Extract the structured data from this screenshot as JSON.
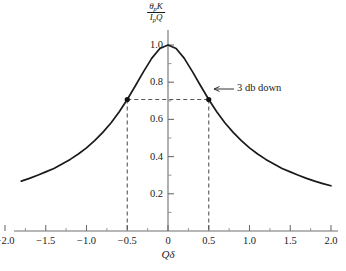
{
  "chart_data": {
    "type": "line",
    "title": "",
    "subtitle": "",
    "xlabel": "Qδ",
    "ylabel_numerator": "θpK",
    "ylabel_denominator": "IpQ",
    "ylabel": "θpK / IpQ",
    "xlim": [
      -2.15,
      2.15
    ],
    "ylim": [
      0,
      1.08
    ],
    "grid": false,
    "legend": false,
    "x_ticks": [
      -2.0,
      -1.5,
      -1.0,
      -0.5,
      0,
      0.5,
      1.0,
      1.5,
      2.0
    ],
    "x_tick_labels": [
      "−2.0",
      "−1.5",
      "−1.0",
      "−0.5",
      "0",
      "0.5",
      "1.0",
      "1.5",
      "2.0"
    ],
    "x_minor_ticks": [
      -1.75,
      -1.25,
      -0.75,
      -0.25,
      0.25,
      0.75,
      1.25,
      1.75
    ],
    "y_ticks": [
      0.2,
      0.4,
      0.6,
      0.8,
      1.0
    ],
    "y_tick_labels": [
      "0.2",
      "0.4",
      "0.6",
      "0.8",
      "1.0"
    ],
    "y_minor_ticks": [
      0.1,
      0.3,
      0.5,
      0.7,
      0.9
    ],
    "series": [
      {
        "name": "normalized resonance response",
        "formula": "1 / sqrt(1 + (2*x)^2)",
        "x": [
          -1.8,
          -1.7,
          -1.6,
          -1.5,
          -1.4,
          -1.3,
          -1.2,
          -1.1,
          -1.0,
          -0.9,
          -0.8,
          -0.7,
          -0.6,
          -0.5,
          -0.4,
          -0.3,
          -0.2,
          -0.1,
          0.0,
          0.1,
          0.2,
          0.3,
          0.4,
          0.5,
          0.6,
          0.7,
          0.8,
          0.9,
          1.0,
          1.1,
          1.2,
          1.3,
          1.4,
          1.5,
          1.6,
          1.7,
          1.8,
          1.9,
          2.0
        ],
        "y": [
          0.268,
          0.283,
          0.3,
          0.318,
          0.336,
          0.36,
          0.385,
          0.414,
          0.447,
          0.486,
          0.53,
          0.581,
          0.64,
          0.707,
          0.781,
          0.857,
          0.928,
          0.981,
          1.0,
          0.981,
          0.928,
          0.857,
          0.781,
          0.707,
          0.64,
          0.581,
          0.53,
          0.486,
          0.447,
          0.414,
          0.385,
          0.36,
          0.336,
          0.318,
          0.3,
          0.283,
          0.268,
          0.255,
          0.243
        ]
      }
    ],
    "markers": [
      {
        "x": -0.5,
        "y": 0.707
      },
      {
        "x": 0.5,
        "y": 0.707
      }
    ],
    "annotations": [
      {
        "text": "3 db down",
        "x": 0.5,
        "y": 0.707,
        "note": "arrow pointing left to right marker at half-power point"
      }
    ],
    "guide_lines": [
      {
        "type": "horizontal",
        "y": 0.707,
        "from_x": -0.5,
        "to_x": 0.5,
        "style": "dashed"
      },
      {
        "type": "vertical",
        "x": -0.5,
        "from_y": 0.0,
        "to_y": 0.707,
        "style": "dashed"
      },
      {
        "type": "vertical",
        "x": 0.5,
        "from_y": 0.0,
        "to_y": 0.707,
        "style": "dashed"
      }
    ],
    "peak_value": 1.0,
    "half_power_value": 0.707
  },
  "colors": {
    "curve": "#1a1a1a",
    "axis": "#6e6e6e",
    "dashed": "#555555",
    "marker": "#111111",
    "background": "#ffffff",
    "text": "#1a1a1a"
  },
  "xaxis": {
    "label": "Qδ",
    "tick_labels": [
      "−2.0",
      "−1.5",
      "−1.0",
      "−0.5",
      "0",
      "0.5",
      "1.0",
      "1.5",
      "2.0"
    ]
  },
  "yaxis": {
    "numerator": "θpK",
    "denominator": "IpQ",
    "tick_labels": [
      "0.2",
      "0.4",
      "0.6",
      "0.8",
      "1.0"
    ]
  },
  "annotation": {
    "three_db_down": "3 db down"
  }
}
